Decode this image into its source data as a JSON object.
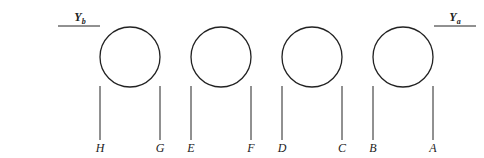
{
  "diagram": {
    "top_labels": [
      {
        "id": "Yb",
        "base": "Y",
        "sub": "b",
        "x": 80,
        "line": [
          58,
          100
        ]
      },
      {
        "id": "Ya",
        "base": "Y",
        "sub": "a",
        "x": 455,
        "line": [
          434,
          476
        ]
      }
    ],
    "circles": [
      {
        "cx": 130,
        "cy": 57,
        "r": 30
      },
      {
        "cx": 221,
        "cy": 57,
        "r": 30
      },
      {
        "cx": 312,
        "cy": 57,
        "r": 30
      },
      {
        "cx": 403,
        "cy": 57,
        "r": 30
      }
    ],
    "lines": [
      {
        "label": "H",
        "x": 100
      },
      {
        "label": "G",
        "x": 160
      },
      {
        "label": "E",
        "x": 191
      },
      {
        "label": "F",
        "x": 251
      },
      {
        "label": "D",
        "x": 282
      },
      {
        "label": "C",
        "x": 342
      },
      {
        "label": "B",
        "x": 373
      },
      {
        "label": "A",
        "x": 433
      }
    ],
    "colors": {
      "stroke": "#222222",
      "ghost_text": "#e9e9e9"
    }
  }
}
